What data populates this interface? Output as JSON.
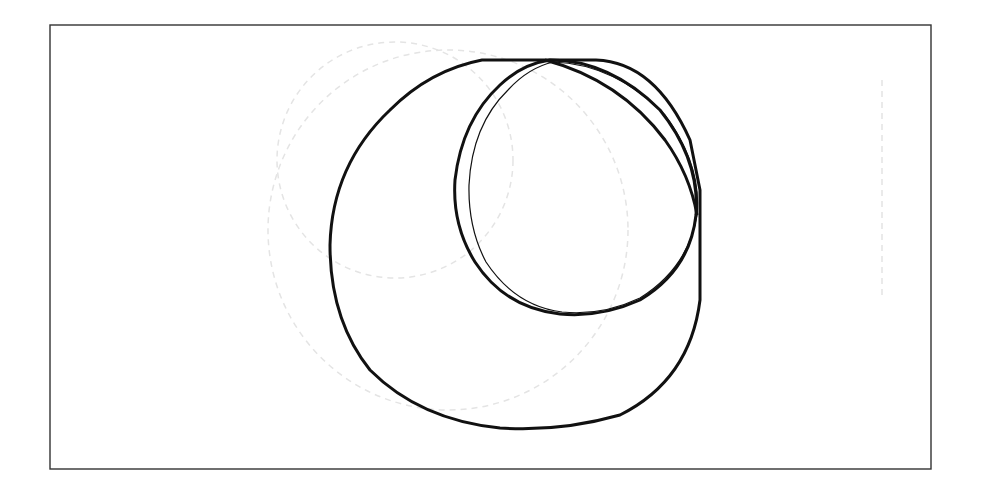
{
  "figure": {
    "width": 981,
    "height": 494,
    "background": "#ffffff",
    "frame": {
      "x": 50,
      "y": 25,
      "width": 881,
      "height": 444,
      "stroke": "#333333",
      "stroke_width": 1.4
    },
    "faint_arcs": {
      "stroke": "#e4e4e4",
      "items": [
        {
          "name": "faint-circle-left",
          "cx": 395,
          "cy": 160,
          "r": 118
        },
        {
          "name": "faint-circle-middle",
          "cx": 448,
          "cy": 230,
          "r": 180
        },
        {
          "name": "faint-line-right",
          "x1": 882,
          "y1": 80,
          "x2": 882,
          "y2": 300
        }
      ]
    },
    "shapes": [
      {
        "name": "large-circle",
        "stroke": "#111111",
        "stroke_width": 3,
        "path": "M 482 60 L 596 60 Q 655 62 690 140 L 700 190 L 700 300 Q 690 380 620 415 Q 560 432 500 428 Q 420 420 370 370 Q 330 320 330 245 Q 332 165 390 110 Q 430 70 482 60 Z"
      },
      {
        "name": "small-circle-outer",
        "stroke": "#111111",
        "stroke_width": 3,
        "path": "M 550 60 Q 610 60 660 110 Q 700 160 696 215 Q 690 270 640 300 Q 600 318 560 314 Q 505 308 475 262 Q 452 225 455 180 Q 462 120 500 85 Q 522 64 550 60 Z"
      },
      {
        "name": "small-circle-inner",
        "stroke": "#111111",
        "stroke_width": 1.2,
        "path": "M 553 62 Q 615 64 665 115 Q 702 165 697 215 Q 688 268 640 298 Q 602 316 562 312 Q 515 306 486 262 Q 468 228 469 185 Q 472 125 508 90 Q 528 68 553 62 Z"
      },
      {
        "name": "diagonal-chord",
        "stroke": "#111111",
        "stroke_width": 3,
        "path": "M 545 60 Q 620 80 665 140 Q 690 175 697 215"
      }
    ]
  }
}
